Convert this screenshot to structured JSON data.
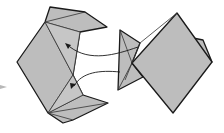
{
  "diagram": {
    "type": "origami-folding-step",
    "colors": {
      "paper": "#bdbdbd",
      "paper_light": "#c8c8c8",
      "outline": "#1a1a1a",
      "crease": "#3a3a3a",
      "step_arrow": "#b8b8b8"
    },
    "left_model": {
      "outline": "50,7 85,12 107,27 80,32 73,75 83,95 108,103 73,120 63,123 48,113 17,62 45,22"
    },
    "right_model": {
      "triangle": "120,30 140,43 132,63 143,77 118,90",
      "diamond": "177,13 212,62 173,113 132,63",
      "flap": "193,38 203,40 212,62"
    },
    "arrows": [
      {
        "name": "upper-tuck-arrow",
        "path": "M138,47 C115,55 90,62 70,47"
      },
      {
        "name": "lower-tuck-arrow",
        "path": "M120,72 C100,70 82,72 74,86"
      }
    ],
    "step_indicator": {
      "name": "previous-step-arrow"
    }
  }
}
